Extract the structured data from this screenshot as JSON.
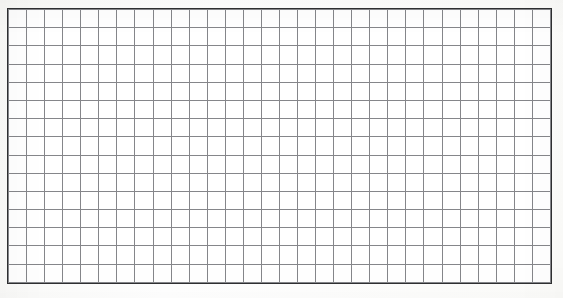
{
  "document": {
    "kind": "grid-paper-scan",
    "title": "",
    "caption": "",
    "background_color": "#ffffff"
  },
  "grid": {
    "name": "graph-paper-grid",
    "columns": 30,
    "rows": 15,
    "cell_width_px": 18.1,
    "cell_height_px": 18.3,
    "origin_x_px": 8,
    "origin_y_px": 9,
    "width_px": 543,
    "height_px": 274,
    "line_color": "#85868a",
    "line_width_px": 1,
    "border_color": "#2e2f31",
    "border_width_px": 1.4,
    "cell_fill_color": "#ffffff",
    "cells": []
  },
  "labels": {
    "column_headers": [],
    "row_headers": []
  },
  "annotations": []
}
